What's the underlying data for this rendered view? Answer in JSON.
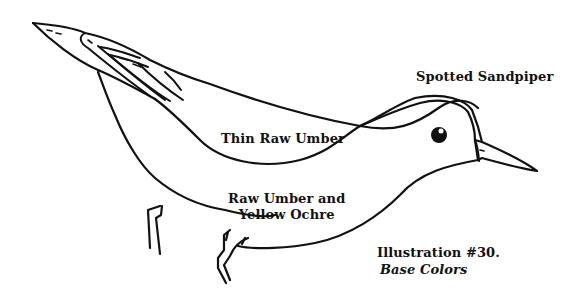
{
  "illustration": {
    "subject": "Spotted Sandpiper",
    "regions": {
      "upper": "Thin Raw Umber",
      "lower_line1": "Raw Umber and",
      "lower_line2": "Yellow Ochre"
    },
    "caption": {
      "number": "Illustration #30.",
      "subtitle": "Base Colors"
    },
    "colors": {
      "ink": "#111111",
      "background": "#ffffff"
    }
  }
}
